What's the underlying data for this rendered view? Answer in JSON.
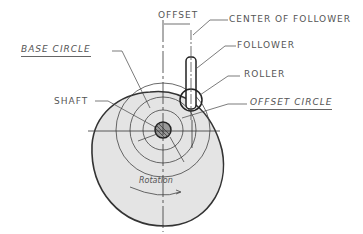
{
  "diagram": {
    "type": "cam-and-follower",
    "labels": {
      "offset": "OFFSET",
      "center_of_follower": "CENTER OF FOLLOWER",
      "follower": "FOLLOWER",
      "roller": "ROLLER",
      "base_circle": "BASE CIRCLE",
      "offset_circle": "OFFSET CIRCLE",
      "shaft": "SHAFT",
      "rotation": "Rotation"
    },
    "colors": {
      "cam_fill": "#e4e4e4",
      "line": "#333333",
      "text": "#555555"
    }
  }
}
